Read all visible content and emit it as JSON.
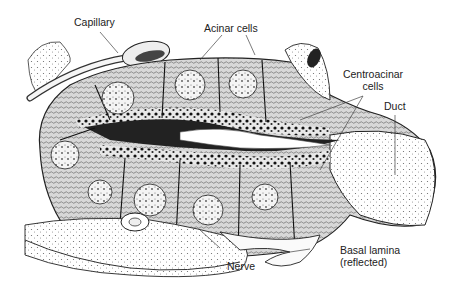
{
  "figure": {
    "labels": {
      "capillary": "Capillary",
      "acinar_cells": "Acinar cells",
      "centroacinar_line1": "Centroacinar",
      "centroacinar_line2": "cells",
      "duct": "Duct",
      "nerve": "Nerve",
      "basal_lamina_line1": "Basal lamina",
      "basal_lamina_line2": "(reflected)"
    }
  }
}
